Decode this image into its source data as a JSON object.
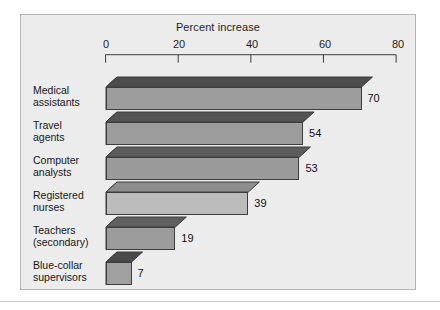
{
  "chart_data": {
    "type": "bar",
    "orientation": "horizontal",
    "title": "Percent increase",
    "xlabel": "Percent increase",
    "ylabel": "",
    "xlim": [
      0,
      80
    ],
    "xticks": [
      0,
      20,
      40,
      60,
      80
    ],
    "xtick_labels": [
      "0",
      "20",
      "40",
      "60",
      "80"
    ],
    "grid": false,
    "legend": false,
    "style": "3d-horizontal-bars",
    "categories": [
      "Medical\nassistants",
      "Travel\nagents",
      "Computer\nanalysts",
      "Registered\nnurses",
      "Teachers\n(secondary)",
      "Blue-collar\nsupervisors"
    ],
    "values": [
      70,
      54,
      53,
      39,
      19,
      7
    ],
    "value_labels": [
      "70",
      "54",
      "53",
      "39",
      "19",
      "7"
    ],
    "bar_colors_front": [
      "#9d9d9d",
      "#9d9d9d",
      "#9a9a9a",
      "#bcbcbc",
      "#9b9b9b",
      "#a0a0a0"
    ],
    "bar_colors_top": [
      "#4d4d4d",
      "#545454",
      "#5c5c5c",
      "#8d8d8d",
      "#606060",
      "#4a4a4a"
    ],
    "bar_colors_side": [
      "#2a2a2a",
      "#2f2f2f",
      "#3a3a3a",
      "#6e6e6e",
      "#3a3a3a",
      "#272727"
    ]
  },
  "figure": {
    "background_color": "#ececec",
    "border_color": "#b4b4b4",
    "page_background": "#ffffff"
  }
}
